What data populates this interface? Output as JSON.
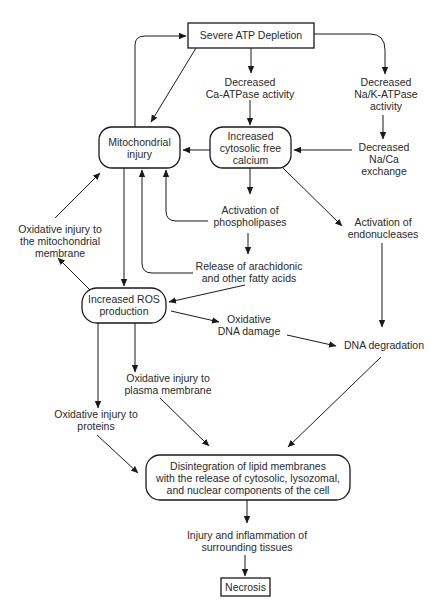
{
  "diagram": {
    "title_node": {
      "lines": [
        "Severe ATP Depletion"
      ]
    },
    "nodes": {
      "atp": {
        "lines": [
          "Severe ATP Depletion"
        ],
        "shape": "rect"
      },
      "ca_atpase": {
        "lines": [
          "Decreased",
          "Ca-ATPase activity"
        ],
        "shape": "text"
      },
      "nak_atpase": {
        "lines": [
          "Decreased",
          "Na/K-ATPase",
          "activity"
        ],
        "shape": "text"
      },
      "mito": {
        "lines": [
          "Mitochondrial",
          "injury"
        ],
        "shape": "rounded"
      },
      "calcium": {
        "lines": [
          "Increased",
          "cytosolic free",
          "calcium"
        ],
        "shape": "rounded"
      },
      "naca": {
        "lines": [
          "Decreased",
          "Na/Ca",
          "exchange"
        ],
        "shape": "text"
      },
      "phospholipases": {
        "lines": [
          "Activation of",
          "phospholipases"
        ],
        "shape": "text"
      },
      "endonucleases": {
        "lines": [
          "Activation of",
          "endonucleases"
        ],
        "shape": "text"
      },
      "ox_mito": {
        "lines": [
          "Oxidative injury to",
          "the mitochondrial",
          "membrane"
        ],
        "shape": "text"
      },
      "arachidonic": {
        "lines": [
          "Release of arachidonic",
          "and other fatty acids"
        ],
        "shape": "text"
      },
      "ros": {
        "lines": [
          "Increased ROS",
          "production"
        ],
        "shape": "rounded"
      },
      "ox_dna": {
        "lines": [
          "Oxidative",
          "DNA damage"
        ],
        "shape": "text"
      },
      "dna_deg": {
        "lines": [
          "DNA degradation"
        ],
        "shape": "text"
      },
      "ox_plasma": {
        "lines": [
          "Oxidative injury to",
          "plasma membrane"
        ],
        "shape": "text"
      },
      "ox_proteins": {
        "lines": [
          "Oxidative injury to",
          "proteins"
        ],
        "shape": "text"
      },
      "disintegration": {
        "lines": [
          "Disintegration of lipid membranes",
          "with the release of cytosolic, lysozomal,",
          "and nuclear components of the cell"
        ],
        "shape": "rounded"
      },
      "inflammation": {
        "lines": [
          "Injury and inflammation of",
          "surrounding tissues"
        ],
        "shape": "text"
      },
      "necrosis": {
        "lines": [
          "Necrosis"
        ],
        "shape": "rect"
      }
    },
    "edges": [
      [
        "atp",
        "ca_atpase"
      ],
      [
        "atp",
        "nak_atpase"
      ],
      [
        "atp",
        "mito"
      ],
      [
        "mito",
        "atp"
      ],
      [
        "ca_atpase",
        "calcium"
      ],
      [
        "nak_atpase",
        "naca"
      ],
      [
        "naca",
        "calcium"
      ],
      [
        "calcium",
        "mito"
      ],
      [
        "calcium",
        "phospholipases"
      ],
      [
        "calcium",
        "endonucleases"
      ],
      [
        "phospholipases",
        "mito"
      ],
      [
        "phospholipases",
        "arachidonic"
      ],
      [
        "arachidonic",
        "mito"
      ],
      [
        "arachidonic",
        "ros"
      ],
      [
        "mito",
        "ros"
      ],
      [
        "ros",
        "ox_mito"
      ],
      [
        "ox_mito",
        "mito"
      ],
      [
        "ros",
        "ox_dna"
      ],
      [
        "ox_dna",
        "dna_deg"
      ],
      [
        "endonucleases",
        "dna_deg"
      ],
      [
        "ros",
        "ox_plasma"
      ],
      [
        "ros",
        "ox_proteins"
      ],
      [
        "ox_plasma",
        "disintegration"
      ],
      [
        "ox_proteins",
        "disintegration"
      ],
      [
        "dna_deg",
        "disintegration"
      ],
      [
        "disintegration",
        "inflammation"
      ],
      [
        "inflammation",
        "necrosis"
      ]
    ]
  }
}
